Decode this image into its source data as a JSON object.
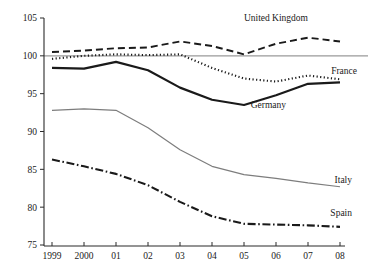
{
  "chart_data": {
    "type": "line",
    "title": "",
    "subtitle": "",
    "xlabel": "",
    "ylabel": "",
    "x": [
      1999,
      2000,
      2001,
      2002,
      2003,
      2004,
      2005,
      2006,
      2007,
      2008
    ],
    "xtick_labels": [
      "1999",
      "2000",
      "01",
      "02",
      "03",
      "04",
      "05",
      "06",
      "07",
      "08"
    ],
    "ytick_labels": [
      "105",
      "100",
      "95",
      "90",
      "85",
      "80",
      "75"
    ],
    "ytick_values": [
      105,
      100,
      95,
      90,
      85,
      80,
      75
    ],
    "ylim": [
      75,
      105
    ],
    "xlim": [
      1999,
      2008
    ],
    "grid": false,
    "legend_position": "inline-right",
    "reference_line": {
      "value": 100,
      "color": "#9a9a9a"
    },
    "series": [
      {
        "name": "United Kingdom",
        "style": "dashed",
        "color": "#1a1a1a",
        "width": 1.9,
        "label_x": 308,
        "label_y": 21,
        "values": [
          100.5,
          100.7,
          101.0,
          101.1,
          101.9,
          101.3,
          100.2,
          101.6,
          102.4,
          101.9
        ]
      },
      {
        "name": "France",
        "style": "dotted",
        "color": "#1a1a1a",
        "width": 2.1,
        "label_x": 357,
        "label_y": 74,
        "values": [
          99.6,
          100.0,
          100.2,
          100.1,
          100.2,
          98.4,
          97.0,
          96.6,
          97.4,
          96.9
        ]
      },
      {
        "name": "Germany",
        "style": "solid",
        "color": "#1a1a1a",
        "width": 2.2,
        "label_x": 286,
        "label_y": 108,
        "values": [
          98.4,
          98.3,
          99.2,
          98.1,
          95.8,
          94.2,
          93.5,
          94.8,
          96.3,
          96.5
        ]
      },
      {
        "name": "Italy",
        "style": "solid",
        "color": "#7d7d7d",
        "width": 1.2,
        "label_x": 352,
        "label_y": 183,
        "values": [
          92.8,
          93.0,
          92.8,
          90.5,
          87.6,
          85.4,
          84.3,
          83.8,
          83.2,
          82.7
        ]
      },
      {
        "name": "Spain",
        "style": "dashdot",
        "color": "#1a1a1a",
        "width": 2.1,
        "label_x": 352,
        "label_y": 216,
        "values": [
          86.3,
          85.4,
          84.4,
          82.9,
          80.7,
          78.8,
          77.8,
          77.7,
          77.6,
          77.4
        ]
      }
    ]
  },
  "axes": {
    "x_axis_y": 246,
    "y_axis_x": 44,
    "plot_left": 52,
    "plot_right": 340,
    "plot_top": 18,
    "plot_bottom": 245
  }
}
